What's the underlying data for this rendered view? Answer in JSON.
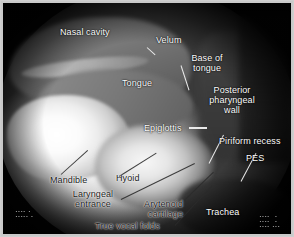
{
  "figure": {
    "kind": "lateral-videofluoroscopic-swallow-study",
    "modality_note": "grayscale radiographic still",
    "background_color": "#050505",
    "frame_color": "#c9c9c9",
    "label_color": "#ffffff",
    "leader_color": "#f2f2f2"
  },
  "annotations": [
    {
      "id": "nasal-cavity",
      "text": "Nasal cavity",
      "tone": "light"
    },
    {
      "id": "velum",
      "text": "Velum",
      "tone": "light"
    },
    {
      "id": "base-of-tongue",
      "text": "Base of\ntongue",
      "tone": "light"
    },
    {
      "id": "tongue",
      "text": "Tongue",
      "tone": "light"
    },
    {
      "id": "posterior-pharyngeal-wall",
      "text": "Posterior\npharyngeal\nwall",
      "tone": "light"
    },
    {
      "id": "epiglottis",
      "text": "Epiglottis",
      "tone": "light"
    },
    {
      "id": "piriform-recess",
      "text": "Piriform recess",
      "tone": "light"
    },
    {
      "id": "pes",
      "text": "PES",
      "tone": "light"
    },
    {
      "id": "mandible",
      "text": "Mandible",
      "tone": "dark"
    },
    {
      "id": "hyoid",
      "text": "Hyoid",
      "tone": "dark"
    },
    {
      "id": "laryngeal-entrance",
      "text": "Laryngeal\nentrance",
      "tone": "dark"
    },
    {
      "id": "arytenoid-cartilage",
      "text": "Arytenoid\ncartilage",
      "tone": "dark"
    },
    {
      "id": "true-vocal-folds",
      "text": "True vocal folds",
      "tone": "dark"
    },
    {
      "id": "trachea",
      "text": "Trachea",
      "tone": "light"
    }
  ],
  "machine_overlay": {
    "bottom_left": "▪▪▪▪ ▪\n▪▪▪▪▪ ▪",
    "bottom_right": "▪▪▪▪  ▪\n▪▪▪▪  ▪\n▪▪▪▪ ▪▪▪"
  }
}
